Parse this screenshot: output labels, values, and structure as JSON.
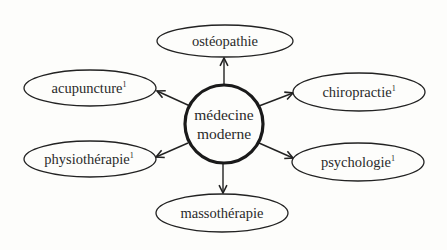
{
  "diagram": {
    "type": "hub-and-spoke",
    "center": {
      "line1": "médecine",
      "line2": "moderne"
    },
    "nodes": [
      {
        "id": "osteopathie",
        "label": "ostéopathie",
        "sup": ""
      },
      {
        "id": "acupuncture",
        "label": "acupuncture",
        "sup": "1"
      },
      {
        "id": "chiropractie",
        "label": "chiropractie",
        "sup": "1"
      },
      {
        "id": "physiotherapie",
        "label": "physiothérapie",
        "sup": "1"
      },
      {
        "id": "psychologie",
        "label": "psychologie",
        "sup": "1"
      },
      {
        "id": "massotherapie",
        "label": "massothérapie",
        "sup": ""
      }
    ],
    "edges": [
      {
        "from": "médecine moderne",
        "to": "ostéopathie"
      },
      {
        "from": "médecine moderne",
        "to": "acupuncture"
      },
      {
        "from": "médecine moderne",
        "to": "chiropractie"
      },
      {
        "from": "médecine moderne",
        "to": "physiothérapie"
      },
      {
        "from": "médecine moderne",
        "to": "psychologie"
      },
      {
        "from": "médecine moderne",
        "to": "massothérapie"
      }
    ],
    "colors": {
      "stroke": "#222222",
      "background": "#fdfdfb",
      "text": "#2a2a2a"
    }
  }
}
